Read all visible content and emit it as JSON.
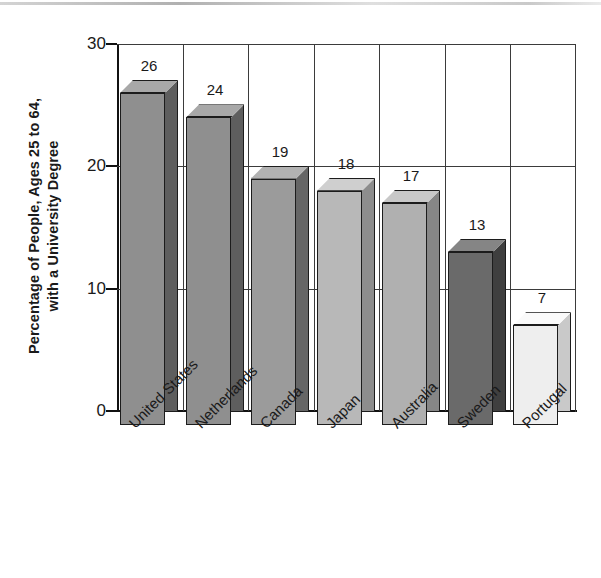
{
  "chart_data": {
    "type": "bar",
    "title": "",
    "subtitle": "",
    "xlabel": "",
    "ylabel_line1": "Percentage of People, Ages 25 to 64,",
    "ylabel_line2": "with a University Degree",
    "categories": [
      "United States",
      "Netherlands",
      "Canada",
      "Japan",
      "Australia",
      "Sweden",
      "Portugal"
    ],
    "values": [
      26,
      24,
      19,
      18,
      17,
      13,
      7
    ],
    "value_labels": [
      "26",
      "24",
      "19",
      "18",
      "17",
      "13",
      "7"
    ],
    "ylim": [
      0,
      30
    ],
    "ytick_values": [
      0,
      10,
      20,
      30
    ],
    "ytick_labels": [
      "0",
      "10",
      "20",
      "30"
    ],
    "grid": "horizontal-and-vertical",
    "legend": "none",
    "bar_style": "3d-isometric",
    "bar_colors": [
      "#8f8f8f",
      "#8f8f8f",
      "#9b9b9b",
      "#b8b8b8",
      "#b0b0b0",
      "#6a6a6a",
      "#eeeeee"
    ],
    "bar_top_colors": [
      "#a8a8a8",
      "#a8a8a8",
      "#b2b2b2",
      "#cfcfcf",
      "#c8c8c8",
      "#858585",
      "#fafafa"
    ],
    "bar_side_colors": [
      "#5e5e5e",
      "#5e5e5e",
      "#666666",
      "#8d8d8d",
      "#868686",
      "#3f3f3f",
      "#c9c9c9"
    ],
    "axis_color": "#111111",
    "grid_color": "#3b3b3b"
  }
}
